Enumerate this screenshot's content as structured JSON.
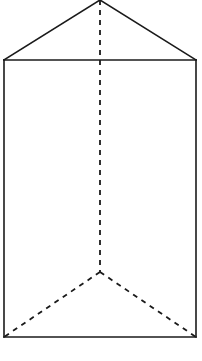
{
  "diagram": {
    "type": "triangular-prism",
    "canvas": {
      "width": 202,
      "height": 361
    },
    "colors": {
      "background": "#ffffff",
      "stroke": "#1a1a1a"
    },
    "vertices": {
      "top_back": [
        100,
        0
      ],
      "top_left": [
        4,
        60
      ],
      "top_right": [
        196,
        60
      ],
      "bottom_back": [
        100,
        272
      ],
      "bottom_left": [
        4,
        337
      ],
      "bottom_right": [
        196,
        337
      ]
    },
    "solid_edges": [
      {
        "name": "top-left-slant",
        "from": "top_left",
        "to": "top_back"
      },
      {
        "name": "top-right-slant",
        "from": "top_back",
        "to": "top_right"
      },
      {
        "name": "top-front",
        "from": "top_left",
        "to": "top_right"
      },
      {
        "name": "left-vertical",
        "from": "top_left",
        "to": "bottom_left"
      },
      {
        "name": "right-vertical",
        "from": "top_right",
        "to": "bottom_right"
      },
      {
        "name": "bottom-front",
        "from": "bottom_left",
        "to": "bottom_right"
      }
    ],
    "hidden_edges": [
      {
        "name": "back-vertical",
        "from": "top_back",
        "to": "bottom_back"
      },
      {
        "name": "bottom-left-slant",
        "from": "bottom_back",
        "to": "bottom_left"
      },
      {
        "name": "bottom-right-slant",
        "from": "bottom_back",
        "to": "bottom_right"
      }
    ]
  }
}
